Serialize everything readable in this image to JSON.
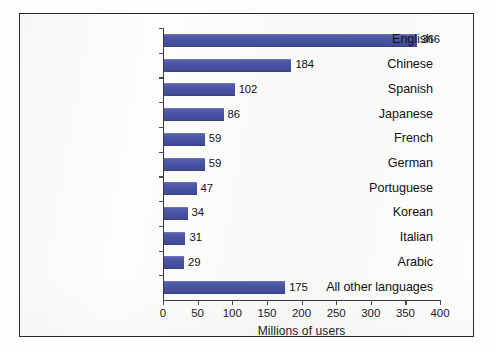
{
  "chart_data": {
    "type": "bar",
    "orientation": "horizontal",
    "title": "",
    "subtitle": "",
    "xlabel": "Millions of users",
    "ylabel": "",
    "xlim": [
      0,
      400
    ],
    "xticks": [
      0,
      50,
      100,
      150,
      200,
      250,
      300,
      350,
      400
    ],
    "xtick_labels": [
      "0",
      "50",
      "100",
      "150",
      "200",
      "250",
      "300",
      "350",
      "400"
    ],
    "grid": false,
    "legend": false,
    "bar_color": "#4a53a2",
    "categories": [
      "English",
      "Chinese",
      "Spanish",
      "Japanese",
      "French",
      "German",
      "Portuguese",
      "Korean",
      "Italian",
      "Arabic",
      "All other languages"
    ],
    "values": [
      366,
      184,
      102,
      86,
      59,
      59,
      47,
      34,
      31,
      29,
      175
    ],
    "value_labels": [
      "366",
      "184",
      "102",
      "86",
      "59",
      "59",
      "47",
      "34",
      "31",
      "29",
      "175"
    ],
    "series": [
      {
        "name": "Millions of users",
        "values": [
          366,
          184,
          102,
          86,
          59,
          59,
          47,
          34,
          31,
          29,
          175
        ]
      }
    ]
  }
}
